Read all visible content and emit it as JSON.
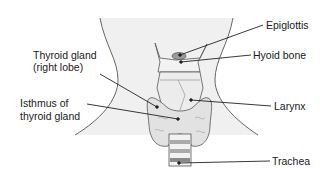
{
  "diagram": {
    "labels": {
      "epiglottis": "Epiglottis",
      "hyoid": "Hyoid bone",
      "thyroid_line1": "Thyroid gland",
      "thyroid_line2": "(right lobe)",
      "isthmus_line1": "Isthmus of",
      "isthmus_line2": "thyroid gland",
      "larynx": "Larynx",
      "trachea": "Trachea"
    },
    "colors": {
      "skin": "#efefef",
      "outline": "#555555",
      "tissue": "#e4e4e4",
      "dark_band": "#9a9a9a",
      "leader": "#222222"
    }
  }
}
